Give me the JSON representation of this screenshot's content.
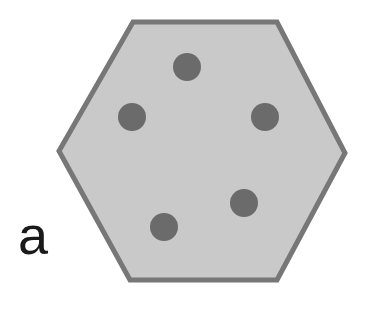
{
  "panel": {
    "label": "a"
  },
  "hexagon": {
    "points": [
      [
        133,
        22
      ],
      [
        277,
        22
      ],
      [
        345,
        153
      ],
      [
        277,
        280
      ],
      [
        130,
        280
      ],
      [
        59,
        151
      ]
    ],
    "fill": "#c9c9c9",
    "stroke": "#777777",
    "stroke_width": 5
  },
  "dots": {
    "fill": "#6b6b6b",
    "radius": 14,
    "items": [
      {
        "cx": 187,
        "cy": 67
      },
      {
        "cx": 132,
        "cy": 117
      },
      {
        "cx": 265,
        "cy": 117
      },
      {
        "cx": 244,
        "cy": 203
      },
      {
        "cx": 164,
        "cy": 227
      }
    ]
  }
}
